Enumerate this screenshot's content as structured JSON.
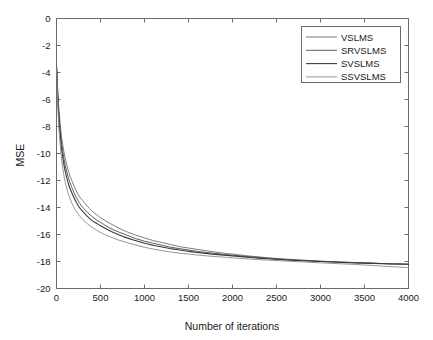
{
  "chart_data": {
    "type": "line",
    "title": "",
    "xlabel": "Number of iterations",
    "ylabel": "MSE",
    "xlim": [
      0,
      4000
    ],
    "ylim": [
      -20,
      0
    ],
    "grid": false,
    "legend_position": "top-right",
    "xticks": [
      0,
      500,
      1000,
      1500,
      2000,
      2500,
      3000,
      3500,
      4000
    ],
    "xtick_labels": [
      "0",
      "500",
      "1000",
      "1500",
      "2000",
      "2500",
      "3000",
      "3500",
      "4000"
    ],
    "yticks": [
      0,
      -2,
      -4,
      -6,
      -8,
      -10,
      -12,
      -14,
      -16,
      -18,
      -20
    ],
    "ytick_labels": [
      "0",
      "-2",
      "-4",
      "-6",
      "-8",
      "-10",
      "-12",
      "-14",
      "-16",
      "-18",
      "-20"
    ],
    "x": [
      0,
      20,
      40,
      60,
      80,
      100,
      140,
      180,
      220,
      260,
      300,
      350,
      400,
      450,
      500,
      600,
      700,
      800,
      900,
      1000,
      1100,
      1200,
      1300,
      1400,
      1500,
      1600,
      1700,
      1800,
      1900,
      2000,
      2200,
      2400,
      2600,
      2800,
      3000,
      3200,
      3400,
      3600,
      3800,
      4000
    ],
    "series": [
      {
        "name": "VSLMS",
        "color": "#6e6e6e",
        "width": 0.9,
        "values": [
          -3.4,
          -6.0,
          -7.7,
          -8.9,
          -9.7,
          -10.4,
          -11.4,
          -12.1,
          -12.7,
          -13.2,
          -13.5,
          -13.9,
          -14.25,
          -14.5,
          -14.75,
          -15.15,
          -15.5,
          -15.8,
          -16.05,
          -16.25,
          -16.45,
          -16.6,
          -16.75,
          -16.9,
          -17.0,
          -17.1,
          -17.2,
          -17.3,
          -17.38,
          -17.45,
          -17.6,
          -17.72,
          -17.82,
          -17.9,
          -17.97,
          -18.03,
          -18.08,
          -18.13,
          -18.17,
          -18.2
        ]
      },
      {
        "name": "SRVSLMS",
        "color": "#4a4a4a",
        "width": 0.9,
        "values": [
          -3.5,
          -6.3,
          -8.1,
          -9.3,
          -10.2,
          -10.9,
          -11.9,
          -12.6,
          -13.2,
          -13.65,
          -14.0,
          -14.35,
          -14.65,
          -14.9,
          -15.1,
          -15.5,
          -15.8,
          -16.05,
          -16.3,
          -16.5,
          -16.65,
          -16.8,
          -16.95,
          -17.05,
          -17.15,
          -17.25,
          -17.33,
          -17.4,
          -17.47,
          -17.53,
          -17.65,
          -17.76,
          -17.85,
          -17.92,
          -17.99,
          -18.04,
          -18.09,
          -18.13,
          -18.17,
          -18.2
        ]
      },
      {
        "name": "SVSLMS",
        "color": "#3a3a3a",
        "width": 1.1,
        "values": [
          -3.55,
          -6.6,
          -8.5,
          -9.75,
          -10.65,
          -11.35,
          -12.35,
          -13.0,
          -13.55,
          -14.0,
          -14.3,
          -14.65,
          -14.95,
          -15.15,
          -15.35,
          -15.7,
          -16.0,
          -16.25,
          -16.45,
          -16.65,
          -16.8,
          -16.93,
          -17.05,
          -17.15,
          -17.25,
          -17.33,
          -17.4,
          -17.47,
          -17.53,
          -17.58,
          -17.7,
          -17.8,
          -17.88,
          -17.95,
          -18.0,
          -18.06,
          -18.1,
          -18.14,
          -18.18,
          -18.2
        ]
      },
      {
        "name": "SSVSLMS",
        "color": "#8a8a8a",
        "width": 0.9,
        "values": [
          -3.6,
          -7.2,
          -9.2,
          -10.5,
          -11.45,
          -12.15,
          -13.1,
          -13.75,
          -14.25,
          -14.6,
          -14.9,
          -15.2,
          -15.45,
          -15.65,
          -15.85,
          -16.15,
          -16.4,
          -16.6,
          -16.78,
          -16.95,
          -17.08,
          -17.2,
          -17.3,
          -17.38,
          -17.45,
          -17.52,
          -17.58,
          -17.63,
          -17.68,
          -17.73,
          -17.82,
          -17.9,
          -17.97,
          -18.03,
          -18.1,
          -18.16,
          -18.22,
          -18.3,
          -18.38,
          -18.45
        ]
      }
    ]
  },
  "legend": {
    "entries": [
      "VSLMS",
      "SRVSLMS",
      "SVSLMS",
      "SSVSLMS"
    ]
  },
  "colors": {
    "axis": "#6b6b6b",
    "text": "#1a1a1a",
    "background": "#ffffff"
  }
}
